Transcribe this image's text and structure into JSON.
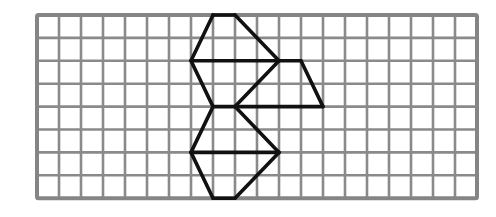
{
  "diagram": {
    "type": "grid-figure",
    "grid": {
      "columns": 20,
      "rows": 8,
      "origin_x": 37,
      "origin_y": 15,
      "cell_width": 22,
      "cell_height": 22.9,
      "line_color": "#8a8a8a",
      "border_color": "#858585"
    },
    "shape": {
      "stroke_color": "#111111",
      "segments": [
        [
          [
            8,
            0
          ],
          [
            9,
            0
          ]
        ],
        [
          [
            8,
            0
          ],
          [
            7,
            2
          ]
        ],
        [
          [
            9,
            0
          ],
          [
            11,
            2
          ]
        ],
        [
          [
            7,
            2
          ],
          [
            12,
            2
          ]
        ],
        [
          [
            7,
            2
          ],
          [
            8,
            4
          ]
        ],
        [
          [
            11,
            2
          ],
          [
            9,
            4
          ]
        ],
        [
          [
            12,
            2
          ],
          [
            13,
            4
          ]
        ],
        [
          [
            8,
            4
          ],
          [
            13,
            4
          ]
        ],
        [
          [
            8,
            4
          ],
          [
            7,
            6
          ]
        ],
        [
          [
            9,
            4
          ],
          [
            11,
            6
          ]
        ],
        [
          [
            7,
            6
          ],
          [
            11,
            6
          ]
        ],
        [
          [
            7,
            6
          ],
          [
            8,
            8
          ]
        ],
        [
          [
            11,
            6
          ],
          [
            9,
            8
          ]
        ],
        [
          [
            8,
            8
          ],
          [
            9,
            8
          ]
        ]
      ]
    }
  }
}
